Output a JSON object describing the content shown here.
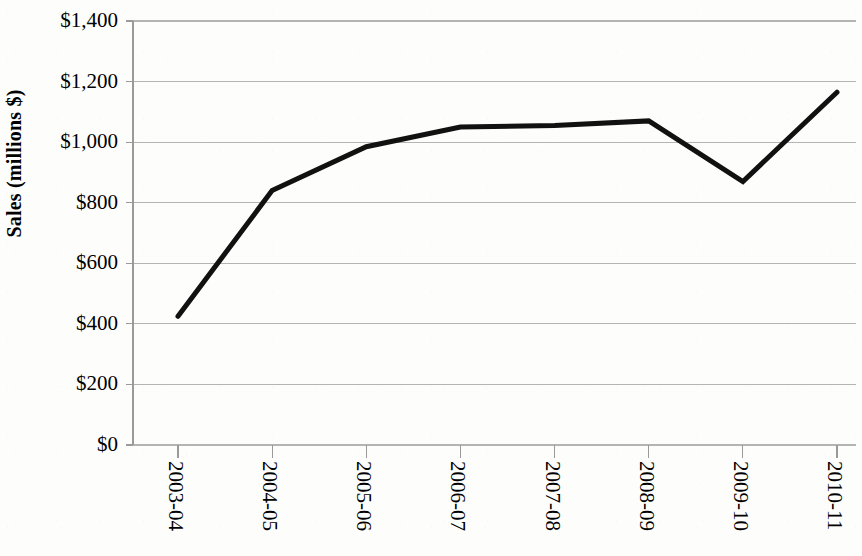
{
  "chart_data": {
    "type": "line",
    "title": "",
    "xlabel": "",
    "ylabel": "Sales (millions $)",
    "categories": [
      "2003-04",
      "2004-05",
      "2005-06",
      "2006-07",
      "2007-08",
      "2008-09",
      "2009-10",
      "2010-11"
    ],
    "values": [
      425,
      840,
      985,
      1050,
      1055,
      1070,
      870,
      1165
    ],
    "series": [
      {
        "name": "Sales",
        "values": [
          425,
          840,
          985,
          1050,
          1055,
          1070,
          870,
          1165
        ]
      }
    ],
    "ylim": [
      0,
      1400
    ],
    "ytick_values": [
      0,
      200,
      400,
      600,
      800,
      1000,
      1200,
      1400
    ],
    "ytick_labels": [
      "$0",
      "$200",
      "$400",
      "$600",
      "$800",
      "$1,000",
      "$1,200",
      "$1,400"
    ],
    "grid": true,
    "grid_axis": "y",
    "legend": false,
    "legend_position": "none",
    "line_color": "#111111",
    "line_width": 5,
    "markers": false,
    "gridline_color": "#b4b4b4",
    "axis_color": "#9a9a9a",
    "background_color": "#fdfdfc",
    "xtick_label_rotation": 90,
    "annotations": []
  }
}
